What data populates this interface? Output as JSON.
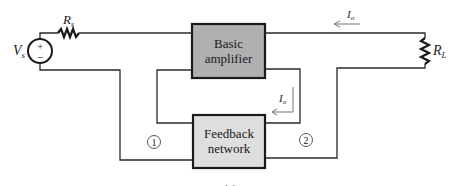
{
  "diagram": {
    "type": "feedback-amplifier-block-diagram",
    "source": {
      "label": "V",
      "subscript": "s",
      "plus": "+",
      "minus": "−"
    },
    "source_resistor": {
      "label": "R",
      "subscript": "s"
    },
    "load_resistor": {
      "label": "R",
      "subscript": "L"
    },
    "blocks": [
      {
        "id": "basic-amplifier",
        "line1": "Basic",
        "line2": "amplifier",
        "fill": "#b0b0b0"
      },
      {
        "id": "feedback-network",
        "line1": "Feedback",
        "line2": "network",
        "fill": "#dedede"
      }
    ],
    "currents": [
      {
        "label": "I",
        "subscript": "o",
        "location": "output-top-wire"
      },
      {
        "label": "I",
        "subscript": "o",
        "location": "feedback-loop"
      }
    ],
    "ports": [
      {
        "label": "1"
      },
      {
        "label": "2"
      }
    ],
    "caption": "(a)"
  }
}
